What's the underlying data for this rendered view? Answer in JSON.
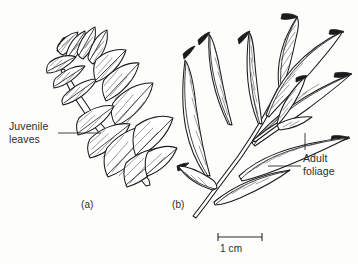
{
  "figure": {
    "background_color": "#fdfdfb",
    "ink_color": "#1b1b1b",
    "text_color": "#2b2b2b",
    "panels": [
      {
        "id": "a",
        "label": "(a)",
        "subject": "juvenile-shoot",
        "leaf_form": "broad ovate overlapping leaves with pinnate venation"
      },
      {
        "id": "b",
        "label": "(b)",
        "subject": "adult-shoot",
        "leaf_form": "narrow lanceolate leaves on slender stem"
      }
    ],
    "annotations": [
      {
        "id": "juvenile",
        "line1": "Juvenile",
        "line2": "leaves",
        "points_to": "panel-a"
      },
      {
        "id": "adult",
        "line1": "Adult",
        "line2": "foliage",
        "points_to": "panel-b"
      }
    ],
    "scale_bar": {
      "caption": "1 cm",
      "length_px": 44
    }
  }
}
